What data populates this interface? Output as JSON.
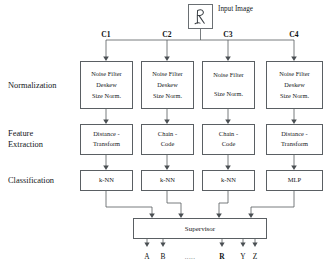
{
  "diagram": {
    "input": {
      "label": "Input Image",
      "glyph_name": "handwritten-r-glyph"
    },
    "column_headers": [
      {
        "id": "C1",
        "label": "C1",
        "cx": 106
      },
      {
        "id": "C2",
        "label": "C2",
        "cx": 167
      },
      {
        "id": "C3",
        "label": "C3",
        "cx": 228
      },
      {
        "id": "C4",
        "label": "C4",
        "cx": 294
      }
    ],
    "stages": [
      {
        "id": "normalization",
        "label_lines": [
          "Normalization"
        ]
      },
      {
        "id": "feature",
        "label_lines": [
          "Feature",
          "Extraction"
        ]
      },
      {
        "id": "classification",
        "label_lines": [
          "Classification"
        ]
      }
    ],
    "columns": [
      {
        "id": "C1",
        "left": 80,
        "width": 53,
        "normalization": [
          "Noise Filter",
          "Deskew",
          "Size Norm."
        ],
        "feature": [
          "Distance -",
          "Transform"
        ],
        "classifier": "k-NN"
      },
      {
        "id": "C2",
        "left": 141,
        "width": 53,
        "normalization": [
          "Noise Filter",
          "Deskew",
          "Size Norm."
        ],
        "feature": [
          "Chain -",
          "Code"
        ],
        "classifier": "k-NN"
      },
      {
        "id": "C3",
        "left": 202,
        "width": 53,
        "normalization": [
          "Noise Filter",
          "",
          "Size Norm."
        ],
        "feature": [
          "Chain -",
          "Code"
        ],
        "classifier": "k-NN"
      },
      {
        "id": "C4",
        "left": 266,
        "width": 57,
        "normalization": [
          "Noise Filter",
          "Deskew",
          "Size Norm."
        ],
        "feature": [
          "Distance -",
          "Transform"
        ],
        "classifier": "MLP"
      }
    ],
    "supervisor": {
      "label": "Supervisor"
    },
    "outputs": [
      {
        "label": "A",
        "cx": 147,
        "bold": false,
        "ellipsis": false,
        "arrow": true
      },
      {
        "label": "B",
        "cx": 163,
        "bold": false,
        "ellipsis": false,
        "arrow": true
      },
      {
        "label": ".....",
        "cx": 190,
        "bold": false,
        "ellipsis": true,
        "arrow": false
      },
      {
        "label": "R",
        "cx": 222,
        "bold": true,
        "ellipsis": false,
        "arrow": true
      },
      {
        "label": "Y",
        "cx": 243,
        "bold": false,
        "ellipsis": false,
        "arrow": true
      },
      {
        "label": "Z",
        "cx": 255,
        "bold": false,
        "ellipsis": false,
        "arrow": true
      }
    ],
    "colors": {
      "background": "#ffffff",
      "line": "#555a5e",
      "box_border": "#5a5f63",
      "text": "#16181a"
    }
  }
}
